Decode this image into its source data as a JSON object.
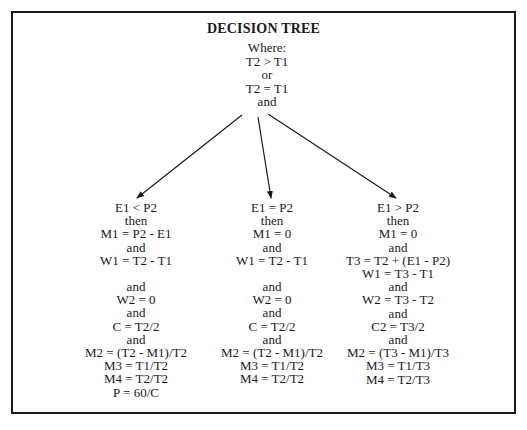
{
  "title": "DECISION TREE",
  "root": {
    "lines": [
      "Where:",
      "T2 > T1",
      "or",
      "T2 = T1",
      "and"
    ]
  },
  "branches": [
    {
      "condition": "E1 < P2",
      "lines": [
        "E1 < P2",
        "then",
        "M1 = P2 - E1",
        "and",
        "W1 = T2 - T1",
        "",
        "and",
        "W2 = 0",
        "and",
        "C = T2/2",
        "and",
        "M2 = (T2 - M1)/T2",
        "M3 = T1/T2",
        "M4 = T2/T2",
        "P = 60/C"
      ]
    },
    {
      "condition": "E1 = P2",
      "lines": [
        "E1 = P2",
        "then",
        "M1 = 0",
        "and",
        "W1 = T2 - T1",
        "",
        "and",
        "W2 = 0",
        "and",
        "C = T2/2",
        "and",
        "M2 = (T2 - M1)/T2",
        "M3 = T1/T2",
        "M4 = T2/T2"
      ]
    },
    {
      "condition": "E1 > P2",
      "lines": [
        "E1 > P2",
        "then",
        "M1 = 0",
        "and",
        "T3 = T2 + (E1 - P2)",
        "W1 = T3 - T1",
        "and",
        "W2 = T3 - T2",
        "and",
        "C2 = T3/2",
        "and",
        "M2 = (T3 - M1)/T3",
        "M3 = T1/T3",
        "M4 = T2/T3"
      ]
    }
  ],
  "colors": {
    "ink": "#1a1a1a",
    "background": "#ffffff"
  }
}
